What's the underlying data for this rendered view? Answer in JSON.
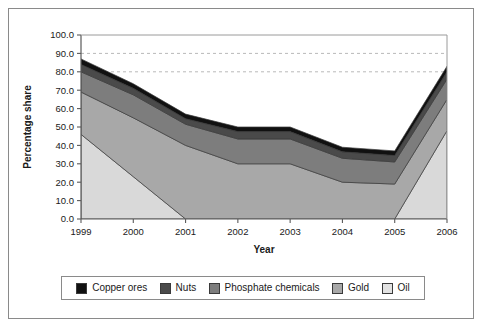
{
  "chart_data": {
    "type": "area",
    "title": "",
    "xlabel": "Year",
    "ylabel": "Percentage share",
    "categories": [
      "1999",
      "2000",
      "2001",
      "2002",
      "2003",
      "2004",
      "2005",
      "2006"
    ],
    "x": [
      1999,
      2000,
      2001,
      2002,
      2003,
      2004,
      2005,
      2006
    ],
    "xlim": [
      1999,
      2006
    ],
    "ylim": [
      0.0,
      100.0
    ],
    "ytick_labels": [
      "0.0",
      "10.0",
      "20.0",
      "30.0",
      "40.0",
      "50.0",
      "60.0",
      "70.0",
      "80.0",
      "90.0",
      "100.0"
    ],
    "ytick_values": [
      0,
      10,
      20,
      30,
      40,
      50,
      60,
      70,
      80,
      90,
      100
    ],
    "ytick_step": 10.0,
    "grid": "horizontal-dashed-upper",
    "gridline_values": [
      80,
      90
    ],
    "stacked": true,
    "stack_order_bottom_to_top": [
      "Oil",
      "Gold",
      "Phosphate chemicals",
      "Nuts",
      "Copper ores"
    ],
    "legend_position": "bottom",
    "series": [
      {
        "name": "Copper ores",
        "color": "#111111",
        "values": [
          3.0,
          2.5,
          2.5,
          2.5,
          2.5,
          2.5,
          2.5,
          3.0
        ]
      },
      {
        "name": "Nuts",
        "color": "#4a4a4a",
        "values": [
          4.0,
          3.5,
          3.0,
          4.0,
          4.0,
          3.5,
          3.5,
          4.0
        ]
      },
      {
        "name": "Phosphate chemicals",
        "color": "#7d7d7d",
        "values": [
          11.0,
          12.5,
          11.5,
          13.5,
          13.5,
          13.0,
          12.0,
          11.0
        ]
      },
      {
        "name": "Gold",
        "color": "#a8a8a8",
        "values": [
          23.0,
          32.0,
          40.0,
          30.0,
          30.0,
          20.0,
          19.0,
          17.0
        ]
      },
      {
        "name": "Oil",
        "color": "#d9d9d9",
        "values": [
          46.0,
          23.0,
          0.0,
          0.0,
          0.0,
          0.0,
          0.0,
          48.0
        ]
      }
    ],
    "cumulative_tops": {
      "Oil": [
        46.0,
        23.0,
        0.0,
        0.0,
        0.0,
        0.0,
        0.0,
        48.0
      ],
      "Gold": [
        69.0,
        55.0,
        40.0,
        50.0,
        50.0,
        39.0,
        39.0,
        65.0
      ],
      "Phosphate chemicals": [
        80.0,
        67.5,
        51.5,
        63.5,
        63.5,
        52.0,
        51.0,
        76.0
      ],
      "Nuts": [
        84.0,
        71.0,
        54.5,
        67.5,
        67.5,
        55.5,
        54.5,
        80.0
      ],
      "Copper ores": [
        87.0,
        73.5,
        57.0,
        70.0,
        70.0,
        58.0,
        57.0,
        83.0
      ]
    }
  },
  "legend": {
    "items": [
      {
        "label": "Copper ores",
        "color": "#111111"
      },
      {
        "label": "Nuts",
        "color": "#4a4a4a"
      },
      {
        "label": "Phosphate chemicals",
        "color": "#7d7d7d"
      },
      {
        "label": "Gold",
        "color": "#a8a8a8"
      },
      {
        "label": "Oil",
        "color": "#e2e2e2"
      }
    ]
  },
  "axes": {
    "y_title": "Percentage share",
    "x_title": "Year"
  }
}
